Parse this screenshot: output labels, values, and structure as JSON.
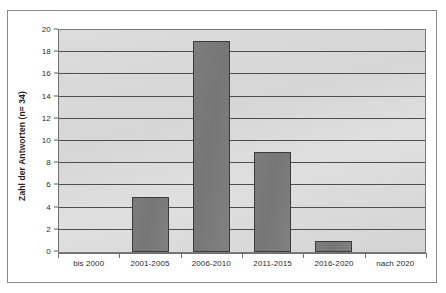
{
  "chart_data": {
    "type": "bar",
    "title": "",
    "subtitle": "",
    "xlabel": "",
    "ylabel": "Zahl der Antworten (n= 34)",
    "categories": [
      "bis 2000",
      "2001-2005",
      "2006-2010",
      "2011-2015",
      "2016-2020",
      "nach 2020"
    ],
    "values": [
      0,
      5,
      19,
      9,
      1,
      0
    ],
    "ylim": [
      0,
      20
    ],
    "ytick_step": 2,
    "yticks": [
      "0",
      "2",
      "4",
      "6",
      "8",
      "10",
      "12",
      "14",
      "16",
      "18",
      "20"
    ],
    "grid": true,
    "grid_axis": "y",
    "legend": false,
    "legend_position": "none",
    "annotations": [],
    "colors": {
      "bar_fill": "#7c7c7c",
      "bar_border": "#3b3b3b",
      "plot_background": "#d8d8d8",
      "gridline": "#4e4e4e",
      "axis": "#6f6f6f",
      "figure_border": "#8a8a8a",
      "text": "#2b2b2b",
      "figure_background": "#ffffff"
    }
  }
}
